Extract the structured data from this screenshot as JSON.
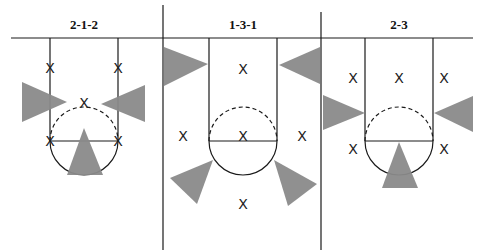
{
  "diagram": {
    "panels": [
      {
        "title": "2-1-2",
        "defenders": [
          "X",
          "X",
          "X",
          "X",
          "X"
        ],
        "coverage_zones": 3
      },
      {
        "title": "1-3-1",
        "defenders": [
          "X",
          "X",
          "X",
          "X",
          "X"
        ],
        "coverage_zones": 4
      },
      {
        "title": "2-3",
        "defenders": [
          "X",
          "X",
          "X",
          "X",
          "X"
        ],
        "coverage_zones": 3
      }
    ],
    "colors": {
      "lines": "#1a1a1a",
      "shaded_zones": "#8a8a8a",
      "background": "#ffffff"
    }
  }
}
